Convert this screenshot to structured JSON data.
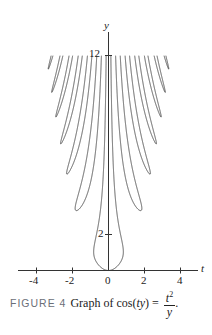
{
  "caption": {
    "figure_label": "FIGURE 4",
    "text": "Graph of cos(",
    "var_t": "t",
    "var_y": "y",
    "text_close": ") =",
    "numerator": "t",
    "numerator_exp": "2",
    "denominator": "y",
    "trailing": "."
  },
  "axes": {
    "x_label": "t",
    "y_label": "y",
    "x_ticks": [
      "-4",
      "-2",
      "0",
      "2",
      "4"
    ],
    "y_ticks": [
      "2",
      "12"
    ]
  },
  "chart_data": {
    "type": "line",
    "equation": "cos(t*y) = t^2 / y",
    "xlabel": "t",
    "ylabel": "y",
    "xlim": [
      -5,
      5
    ],
    "ylim": [
      0,
      12
    ],
    "x_ticks": [
      -4,
      -2,
      0,
      2,
      4
    ],
    "y_ticks_labeled": [
      2,
      12
    ],
    "grid": false,
    "legend": null
  },
  "colors": {
    "curve": "#444444",
    "axis": "#333333",
    "figure_label": "#6b6f78"
  }
}
